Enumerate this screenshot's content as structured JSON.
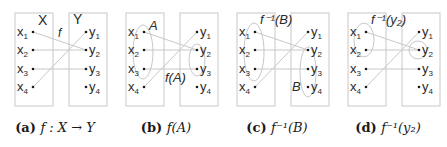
{
  "figure": {
    "colors": {
      "box": "#c8c8c8",
      "line": "#c8c8c8",
      "ellipse": "#c8c8c8",
      "text": "#2a2a2a",
      "dot": "#1a1a1a"
    },
    "domain_elements": [
      "x1",
      "x2",
      "x3",
      "x4"
    ],
    "codomain_elements": [
      "y1",
      "y2",
      "y3",
      "y4"
    ],
    "mapping": [
      {
        "from": "x1",
        "to": "y2"
      },
      {
        "from": "x2",
        "to": "y2"
      },
      {
        "from": "x3",
        "to": "y3"
      },
      {
        "from": "x4",
        "to": "y1"
      }
    ],
    "panels": [
      {
        "id": "a",
        "caption_tag": "(a)",
        "caption_math": "f : X → Y",
        "labels": [
          {
            "text": "X",
            "role": "domain-set-label"
          },
          {
            "text": "f",
            "role": "function-label"
          },
          {
            "text": "Y",
            "role": "codomain-set-label"
          }
        ],
        "highlight_left": [],
        "highlight_right": []
      },
      {
        "id": "b",
        "caption_tag": "(b)",
        "caption_math": "f(A)",
        "labels": [
          {
            "text": "A",
            "role": "subset-label"
          },
          {
            "text": "f(A)",
            "role": "image-label"
          }
        ],
        "highlight_left": [
          "x1",
          "x2",
          "x3"
        ],
        "highlight_right": [
          "y2",
          "y3"
        ]
      },
      {
        "id": "c",
        "caption_tag": "(c)",
        "caption_math": "f⁻¹(B)",
        "labels": [
          {
            "text": "f⁻¹(B)",
            "role": "preimage-label"
          },
          {
            "text": "B",
            "role": "subset-label"
          }
        ],
        "highlight_left": [
          "x1",
          "x2",
          "x3"
        ],
        "highlight_right": [
          "y2",
          "y3",
          "y4"
        ]
      },
      {
        "id": "d",
        "caption_tag": "(d)",
        "caption_math": "f⁻¹(y₂)",
        "labels": [
          {
            "text": "f⁻¹(y₂)",
            "role": "preimage-label"
          }
        ],
        "highlight_left": [
          "x1",
          "x2"
        ],
        "highlight_right": [
          "y2"
        ]
      }
    ]
  }
}
